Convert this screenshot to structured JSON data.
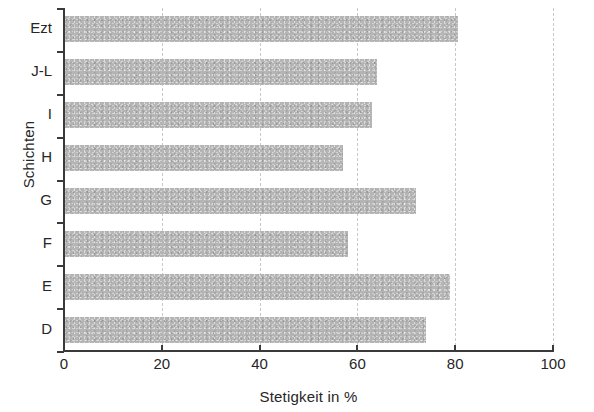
{
  "chart_data": {
    "type": "bar",
    "orientation": "horizontal",
    "title": "",
    "xlabel": "Stetigkeit in %",
    "ylabel": "Schichten",
    "categories": [
      "D",
      "E",
      "F",
      "G",
      "H",
      "I",
      "J-L",
      "Ezt"
    ],
    "values": [
      74,
      79,
      58,
      72,
      57,
      63,
      64,
      80.5
    ],
    "xlim": [
      0,
      100
    ],
    "xticks": [
      0,
      20,
      40,
      60,
      80,
      100
    ],
    "xtick_labels": [
      "0",
      "20",
      "40",
      "60",
      "80",
      "100"
    ],
    "grid": "vertical-dashed",
    "legend": "none",
    "bar_color": "#b5b5b5",
    "axis_color": "#3a3a3a",
    "gridline_color": "#c9c9c9",
    "series": [
      {
        "name": "Stetigkeit",
        "points": [
          {
            "category": "Ezt",
            "value": 80.5
          },
          {
            "category": "J-L",
            "value": 64
          },
          {
            "category": "I",
            "value": 63
          },
          {
            "category": "H",
            "value": 57
          },
          {
            "category": "G",
            "value": 72
          },
          {
            "category": "F",
            "value": 58
          },
          {
            "category": "E",
            "value": 79
          },
          {
            "category": "D",
            "value": 74
          }
        ]
      }
    ]
  },
  "axes": {
    "y_title": "Schichten",
    "x_title": "Stetigkeit in %",
    "y_categories": [
      {
        "label": "Ezt"
      },
      {
        "label": "J-L"
      },
      {
        "label": "I"
      },
      {
        "label": "H"
      },
      {
        "label": "G"
      },
      {
        "label": "F"
      },
      {
        "label": "E"
      },
      {
        "label": "D"
      }
    ],
    "x_ticks": [
      {
        "label": "0"
      },
      {
        "label": "20"
      },
      {
        "label": "40"
      },
      {
        "label": "60"
      },
      {
        "label": "80"
      },
      {
        "label": "100"
      }
    ]
  }
}
